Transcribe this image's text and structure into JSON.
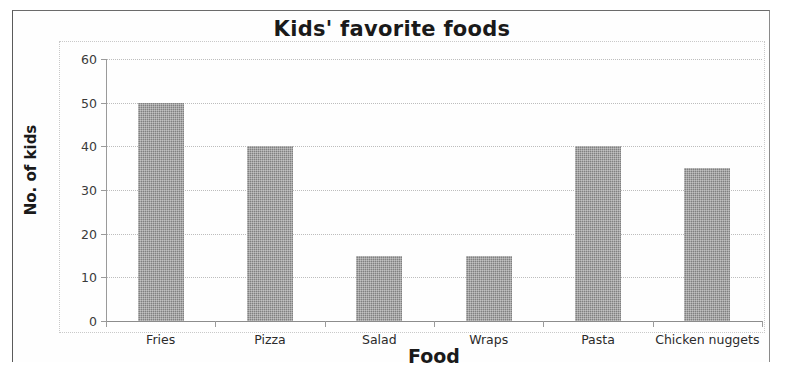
{
  "chart_data": {
    "type": "bar",
    "title": "Kids' favorite foods",
    "xlabel": "Food",
    "ylabel": "No. of kids",
    "categories": [
      "Fries",
      "Pizza",
      "Salad",
      "Wraps",
      "Pasta",
      "Chicken nuggets"
    ],
    "values": [
      50,
      40,
      15,
      15,
      40,
      35
    ],
    "ylim": [
      0,
      60
    ],
    "ytick_labels": [
      "0",
      "10",
      "20",
      "30",
      "40",
      "50",
      "60"
    ],
    "ytick_values": [
      0,
      10,
      20,
      30,
      40,
      50,
      60
    ],
    "grid": true,
    "legend": false,
    "bar_color": "#808080",
    "gridline_color": "#bdbdbd",
    "axis_color": "#8c8c8c",
    "text_color": "#1a1a1a"
  }
}
